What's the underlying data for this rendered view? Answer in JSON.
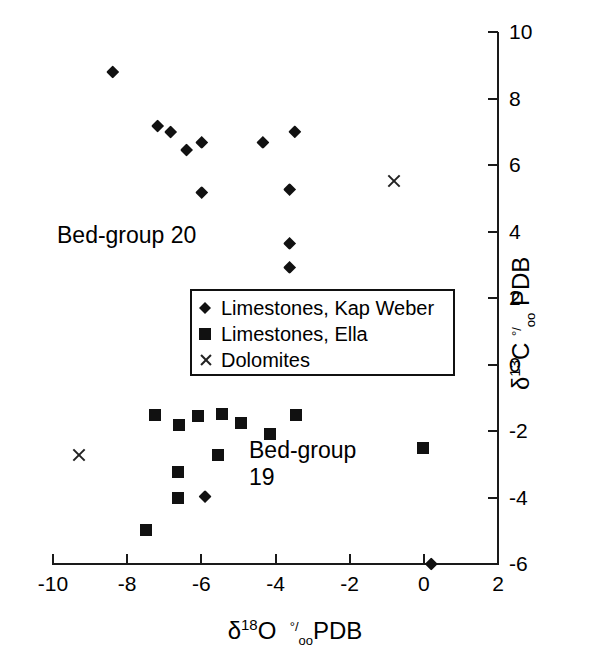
{
  "chart_data": {
    "type": "scatter",
    "title": "",
    "xlabel": "δ18O °/oo PDB",
    "ylabel": "δ13C °/oo PDB",
    "xlim": [
      -10,
      2
    ],
    "ylim": [
      -6,
      10
    ],
    "xticks": [
      -10,
      -8,
      -6,
      -4,
      -2,
      0,
      2
    ],
    "yticks": [
      -6,
      -4,
      -2,
      0,
      2,
      4,
      6,
      8,
      10
    ],
    "xticklabels": [
      "-10",
      "-8",
      "-6",
      "-4",
      "-2",
      "0",
      "2"
    ],
    "yticklabels": [
      "-6",
      "-4",
      "-2",
      "0",
      "2",
      "4",
      "6",
      "8",
      "10"
    ],
    "grid": false,
    "y_axis_position": "right",
    "legend_position": "center",
    "series": [
      {
        "name": "Limestones, Kap Weber",
        "marker": "diamond",
        "color": "#111111",
        "points": [
          {
            "x": -8.39,
            "y": 8.8
          },
          {
            "x": -7.18,
            "y": 7.17
          },
          {
            "x": -6.83,
            "y": 6.99
          },
          {
            "x": -6.4,
            "y": 6.45
          },
          {
            "x": -5.99,
            "y": 6.68
          },
          {
            "x": -4.34,
            "y": 6.68
          },
          {
            "x": -3.48,
            "y": 7.0
          },
          {
            "x": -5.99,
            "y": 5.17
          },
          {
            "x": -3.62,
            "y": 5.26
          },
          {
            "x": -3.62,
            "y": 3.64
          },
          {
            "x": -3.62,
            "y": 2.92
          },
          {
            "x": -5.9,
            "y": -3.97
          },
          {
            "x": 0.2,
            "y": -6.0
          }
        ]
      },
      {
        "name": "Limestones, Ella",
        "marker": "square",
        "color": "#111111",
        "points": [
          {
            "x": -7.26,
            "y": -1.51
          },
          {
            "x": -6.61,
            "y": -1.81
          },
          {
            "x": -6.1,
            "y": -1.54
          },
          {
            "x": -5.43,
            "y": -1.48
          },
          {
            "x": -4.92,
            "y": -1.75
          },
          {
            "x": -4.14,
            "y": -2.08
          },
          {
            "x": -3.46,
            "y": -1.51
          },
          {
            "x": -5.54,
            "y": -2.71
          },
          {
            "x": -6.62,
            "y": -3.22
          },
          {
            "x": -6.62,
            "y": -4.0
          },
          {
            "x": -7.5,
            "y": -4.99
          },
          {
            "x": -0.02,
            "y": -2.51
          }
        ]
      },
      {
        "name": "Dolomites",
        "marker": "cross",
        "color": "#222222",
        "points": [
          {
            "x": -0.8,
            "y": 5.52
          },
          {
            "x": -9.3,
            "y": -2.71
          }
        ]
      }
    ],
    "annotations": [
      {
        "text": "Bed-group 20",
        "x": -8.6,
        "y": 4.2
      },
      {
        "text": "Bed-group\n19",
        "x": -4.6,
        "y": -3.1
      }
    ]
  },
  "axis": {
    "x_title_delta": "δ",
    "x_title_sup": "18",
    "x_title_elem": "O",
    "x_title_unit_pre": "°/",
    "x_title_unit_sub": "oo",
    "x_title_suffix": "PDB",
    "y_title_delta": "δ",
    "y_title_sup": "13",
    "y_title_elem": "C",
    "y_title_unit_pre": "°/",
    "y_title_unit_sub": "oo",
    "y_title_suffix": "PDB"
  },
  "legend": {
    "entries": [
      {
        "label": "Limestones, Kap Weber",
        "marker": "diamond-icon"
      },
      {
        "label": "Limestones, Ella",
        "marker": "square-icon"
      },
      {
        "label": "Dolomites",
        "marker": "cross-icon"
      }
    ]
  }
}
